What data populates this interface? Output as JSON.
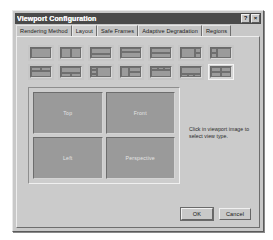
{
  "window": {
    "title": "Viewport Configuration",
    "help_button_label": "?",
    "close_button_label": "×"
  },
  "tabs": [
    {
      "label": "Rendering Method",
      "active": false
    },
    {
      "label": "Layout",
      "active": true
    },
    {
      "label": "Safe Frames",
      "active": false
    },
    {
      "label": "Adaptive Degradation",
      "active": false
    },
    {
      "label": "Regions",
      "active": false
    }
  ],
  "layout_presets": {
    "selected_index": 13,
    "row1": [
      {
        "name": "single"
      },
      {
        "name": "two-vertical"
      },
      {
        "name": "two-horizontal-small-top"
      },
      {
        "name": "two-horizontal-thin-top"
      },
      {
        "name": "two-horizontal-equal"
      },
      {
        "name": "left-large-right-split"
      },
      {
        "name": "right-large-left-split"
      }
    ],
    "row2": [
      {
        "name": "top-split-bottom-wide"
      },
      {
        "name": "top-wide-bottom-split"
      },
      {
        "name": "left-stack-right-wide"
      },
      {
        "name": "left-narrow-right-stack"
      },
      {
        "name": "three-top-one-bottom"
      },
      {
        "name": "one-top-three-bottom"
      },
      {
        "name": "four-quadrant"
      }
    ]
  },
  "preview": {
    "viewports": [
      {
        "label": "Top"
      },
      {
        "label": "Front"
      },
      {
        "label": "Left"
      },
      {
        "label": "Perspective"
      }
    ]
  },
  "hint": {
    "text": "Click in viewport image to select view type."
  },
  "buttons": {
    "ok_label": "OK",
    "cancel_label": "Cancel"
  },
  "colors": {
    "dialog_face": "#c8c8c8",
    "titlebar": "#4a4a4a",
    "viewport_fill": "#9a9a9a",
    "selection_border": "#f4f4f4"
  }
}
